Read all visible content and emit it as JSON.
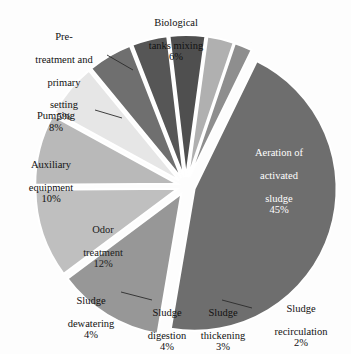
{
  "chart_data": {
    "type": "pie",
    "title": "",
    "subtitle": "",
    "exploded": true,
    "legend": "none",
    "label_format": "name + percent",
    "units": "%",
    "total": 99,
    "categories": [
      "Aeration of activated sludge",
      "Odor treatment",
      "Auxiliary equipment",
      "Pumping",
      "Biological tanks mixing",
      "Pre-treatment and primary setting",
      "Sludge dewatering",
      "Sludge digestion",
      "Sludge thickening",
      "Sludge recirculation"
    ],
    "values": [
      45,
      12,
      10,
      8,
      6,
      5,
      4,
      4,
      3,
      2
    ],
    "colors": [
      "#6e6e6e",
      "#979797",
      "#bfbfbf",
      "#b9b9b9",
      "#e6e6e6",
      "#6f6f6f",
      "#565656",
      "#4f4f4f",
      "#b0b0b0",
      "#8e8e8e"
    ],
    "slices": [
      {
        "name": "Aeration of activated sludge",
        "value": 45,
        "percent": "45%",
        "color": "#6e6e6e",
        "label_placement": "inside",
        "label_color": "#ffffff"
      },
      {
        "name": "Odor treatment",
        "value": 12,
        "percent": "12%",
        "color": "#979797",
        "label_placement": "inside",
        "label_color": "#1c1c1c"
      },
      {
        "name": "Auxiliary equipment",
        "value": 10,
        "percent": "10%",
        "color": "#bfbfbf",
        "label_placement": "outside",
        "label_color": "#111111"
      },
      {
        "name": "Pumping",
        "value": 8,
        "percent": "8%",
        "color": "#b9b9b9",
        "label_placement": "outside-leader",
        "label_color": "#111111"
      },
      {
        "name": "Biological tanks mixing",
        "value": 6,
        "percent": "6%",
        "color": "#e6e6e6",
        "label_placement": "outside",
        "label_color": "#111111"
      },
      {
        "name": "Pre-treatment and primary setting",
        "value": 5,
        "percent": "5%",
        "color": "#6f6f6f",
        "label_placement": "outside-leader",
        "label_color": "#111111"
      },
      {
        "name": "Sludge dewatering",
        "value": 4,
        "percent": "4%",
        "color": "#565656",
        "label_placement": "outside-leader",
        "label_color": "#111111"
      },
      {
        "name": "Sludge digestion",
        "value": 4,
        "percent": "4%",
        "color": "#4f4f4f",
        "label_placement": "outside",
        "label_color": "#111111"
      },
      {
        "name": "Sludge thickening",
        "value": 3,
        "percent": "3%",
        "color": "#b0b0b0",
        "label_placement": "outside",
        "label_color": "#111111"
      },
      {
        "name": "Sludge recirculation",
        "value": 2,
        "percent": "2%",
        "color": "#8e8e8e",
        "label_placement": "outside-leader",
        "label_color": "#111111"
      }
    ]
  },
  "labels": {
    "biological": {
      "line1": "Biological",
      "line2": "tanks mixing",
      "pct": "6%"
    },
    "pretreatment": {
      "line1": "Pre-",
      "line2": "treatment and",
      "line3": "primary",
      "line4": "setting",
      "pct": "5%"
    },
    "pumping": {
      "line1": "Pumping",
      "pct": "8%"
    },
    "auxiliary": {
      "line1": "Auxiliary",
      "line2": "equipment",
      "pct": "10%"
    },
    "odor": {
      "line1": "Odor",
      "line2": "treatment",
      "pct": "12%"
    },
    "aeration": {
      "line1": "Aeration of",
      "line2": "activated",
      "line3": "sludge",
      "pct": "45%"
    },
    "dewatering": {
      "line1": "Sludge",
      "line2": "dewatering",
      "pct": "4%"
    },
    "digestion": {
      "line1": "Sludge",
      "line2": "digestion",
      "pct": "4%"
    },
    "thickening": {
      "line1": "Sludge",
      "line2": "thickening",
      "pct": "3%"
    },
    "recirculation": {
      "line1": "Sludge",
      "line2": "recirculation",
      "pct": "2%"
    }
  },
  "style": {
    "background": "#fdfdfd",
    "gap_color": "#ffffff",
    "leader_color": "#2b2b2b"
  }
}
